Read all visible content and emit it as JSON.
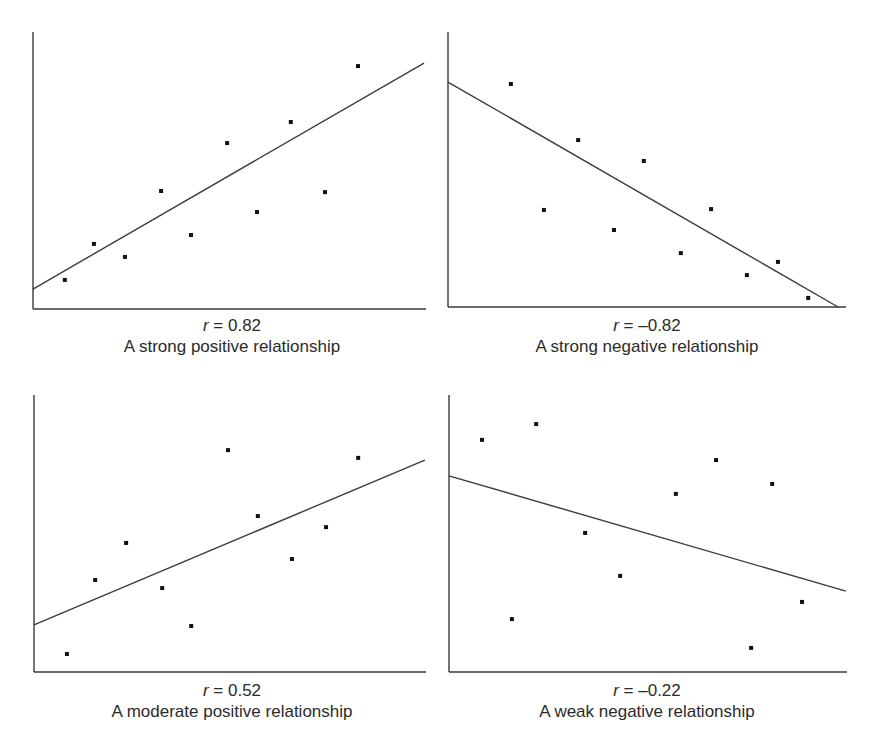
{
  "figure": {
    "title_partial": "Scatterplots with Lines of Best Fit Showing Strength of Correlation",
    "title_visible": false
  },
  "chart_data": [
    {
      "type": "scatter",
      "title": "",
      "xlabel": "",
      "ylabel": "",
      "xlim": [
        0,
        100
      ],
      "ylim": [
        0,
        100
      ],
      "grid": false,
      "r_label_var": "r",
      "r_label_value": " = 0.82",
      "r": 0.82,
      "description": "A strong positive relationship",
      "points": [
        {
          "x": 8.1,
          "y": 10.5
        },
        {
          "x": 15.5,
          "y": 23.5
        },
        {
          "x": 23.4,
          "y": 18.8
        },
        {
          "x": 32.6,
          "y": 42.6
        },
        {
          "x": 40.2,
          "y": 26.7
        },
        {
          "x": 49.4,
          "y": 59.9
        },
        {
          "x": 57.0,
          "y": 35.0
        },
        {
          "x": 65.6,
          "y": 67.5
        },
        {
          "x": 74.3,
          "y": 42.2
        },
        {
          "x": 82.7,
          "y": 87.7
        }
      ],
      "fit_line": {
        "x1": 0,
        "y1": 7.2,
        "x2": 99.5,
        "y2": 88.8
      }
    },
    {
      "type": "scatter",
      "title": "",
      "xlabel": "",
      "ylabel": "",
      "xlim": [
        0,
        100
      ],
      "ylim": [
        0,
        100
      ],
      "grid": false,
      "r_label_var": "r",
      "r_label_value": " = –0.82",
      "r": -0.82,
      "description": "A strong negative relationship",
      "points": [
        {
          "x": 15.8,
          "y": 81.1
        },
        {
          "x": 24.1,
          "y": 35.3
        },
        {
          "x": 32.7,
          "y": 60.7
        },
        {
          "x": 41.7,
          "y": 28.0
        },
        {
          "x": 49.2,
          "y": 53.1
        },
        {
          "x": 58.5,
          "y": 19.6
        },
        {
          "x": 66.1,
          "y": 35.6
        },
        {
          "x": 75.1,
          "y": 11.6
        },
        {
          "x": 82.9,
          "y": 16.4
        },
        {
          "x": 90.5,
          "y": 3.3
        }
      ],
      "fit_line": {
        "x1": 0,
        "y1": 81.8,
        "x2": 98.0,
        "y2": 0
      }
    },
    {
      "type": "scatter",
      "title": "",
      "xlabel": "",
      "ylabel": "",
      "xlim": [
        0,
        100
      ],
      "ylim": [
        0,
        100
      ],
      "grid": false,
      "r_label_var": "r",
      "r_label_value": " = 0.52",
      "r": 0.52,
      "description": "A moderate positive relationship",
      "points": [
        {
          "x": 8.4,
          "y": 6.5
        },
        {
          "x": 15.6,
          "y": 33.2
        },
        {
          "x": 23.5,
          "y": 46.6
        },
        {
          "x": 32.7,
          "y": 30.3
        },
        {
          "x": 40.1,
          "y": 16.6
        },
        {
          "x": 49.5,
          "y": 80.1
        },
        {
          "x": 57.1,
          "y": 56.3
        },
        {
          "x": 65.8,
          "y": 40.8
        },
        {
          "x": 74.5,
          "y": 52.3
        },
        {
          "x": 82.7,
          "y": 77.3
        }
      ],
      "fit_line": {
        "x1": 0,
        "y1": 17.0,
        "x2": 99.7,
        "y2": 76.5
      }
    },
    {
      "type": "scatter",
      "title": "",
      "xlabel": "",
      "ylabel": "",
      "xlim": [
        0,
        100
      ],
      "ylim": [
        0,
        100
      ],
      "grid": false,
      "r_label_var": "r",
      "r_label_value": " = –0.22",
      "r": -0.22,
      "description": "A weak negative relationship",
      "points": [
        {
          "x": 8.3,
          "y": 83.8
        },
        {
          "x": 15.8,
          "y": 19.1
        },
        {
          "x": 21.9,
          "y": 89.5
        },
        {
          "x": 34.2,
          "y": 50.2
        },
        {
          "x": 43.0,
          "y": 34.7
        },
        {
          "x": 57.0,
          "y": 64.3
        },
        {
          "x": 67.1,
          "y": 76.5
        },
        {
          "x": 75.9,
          "y": 8.7
        },
        {
          "x": 81.2,
          "y": 67.9
        },
        {
          "x": 88.7,
          "y": 25.3
        }
      ],
      "fit_line": {
        "x1": 0,
        "y1": 70.8,
        "x2": 99.7,
        "y2": 29.2
      }
    }
  ],
  "style": {
    "axis_color": "#3a3a3a",
    "line_color": "#3c3c3c",
    "point_color": "#111111",
    "caption_color": "#2b2b2b"
  }
}
